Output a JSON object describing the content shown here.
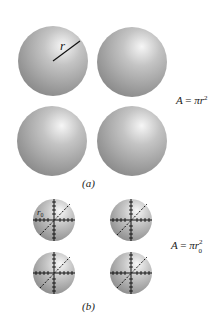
{
  "figure": {
    "panel_a": {
      "caption": "(a)",
      "equation": {
        "lhs": "A",
        "eq": "=",
        "rhs": "πr",
        "sup": "2"
      },
      "radius_label": "r",
      "spheres": [
        {
          "cx": 53,
          "cy": 61,
          "r": 35
        },
        {
          "cx": 132,
          "cy": 62,
          "r": 35
        },
        {
          "cx": 52,
          "cy": 141,
          "r": 35
        },
        {
          "cx": 132,
          "cy": 141,
          "r": 35
        }
      ]
    },
    "panel_b": {
      "caption": "(b)",
      "equation": {
        "lhs": "A",
        "eq": "=",
        "rhs": "πr",
        "sup": "2",
        "sub": "0"
      },
      "radius_label": "r",
      "radius_label_sub": "0",
      "spheres": [
        {
          "cx": 54,
          "cy": 220,
          "r": 21
        },
        {
          "cx": 131,
          "cy": 220,
          "r": 21
        },
        {
          "cx": 54,
          "cy": 273,
          "r": 21
        },
        {
          "cx": 131,
          "cy": 273,
          "r": 21
        }
      ]
    },
    "colors": {
      "sphere_light": "#f4f4f4",
      "sphere_mid": "#b8b8b8",
      "sphere_dark": "#7a7a7a",
      "line": "#111111"
    }
  }
}
